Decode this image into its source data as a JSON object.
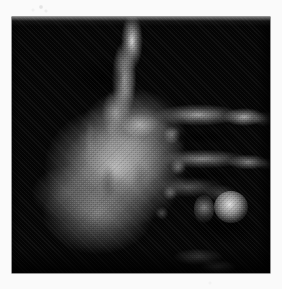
{
  "figure": {
    "kind": "radiograph",
    "view": "dorsopalmar, fingers pointing right",
    "modality_label": "X-ray",
    "caption": "",
    "title": "",
    "page_background_color": "#fafafa",
    "plate": {
      "background_color": "#050505",
      "x": 12,
      "y": 17,
      "width": 258,
      "height": 256,
      "rendering": "grayscale halftone print scan"
    },
    "tones": {
      "black": "#050505",
      "shadow": "#222222",
      "mid_gray": "#8a8a8a",
      "bone_gray": "#bdbdbd",
      "highlight": "#ececec",
      "paper_white": "#fafafa"
    },
    "regions": [
      {
        "name": "thumb-column",
        "label": "thumb / first digit",
        "brightness": "high",
        "cx": 116,
        "cy": 52
      },
      {
        "name": "thumb-web",
        "label": "first web space",
        "brightness": "medium-high",
        "cx": 128,
        "cy": 108
      },
      {
        "name": "palm-mass",
        "label": "metacarpal palm mass",
        "brightness": "high",
        "cx": 104,
        "cy": 150
      },
      {
        "name": "wrist-mass",
        "label": "carpus / wrist",
        "brightness": "medium",
        "cx": 86,
        "cy": 196
      },
      {
        "name": "digit-index",
        "label": "index finger",
        "brightness": "high",
        "cx": 196,
        "cy": 99
      },
      {
        "name": "digit-middle",
        "label": "middle finger",
        "brightness": "medium-high",
        "cx": 200,
        "cy": 143
      },
      {
        "name": "digit-ring",
        "label": "ring finger",
        "brightness": "medium-low",
        "cx": 182,
        "cy": 172
      },
      {
        "name": "knuckles",
        "label": "metacarpophalangeal joints",
        "brightness": "medium-high",
        "cx": 158,
        "cy": 160
      },
      {
        "name": "nodule-highlight",
        "label": "bright round nodule",
        "brightness": "very high",
        "cx": 219,
        "cy": 190
      }
    ],
    "annotations": [],
    "scale_bar": null,
    "markings": [
      {
        "name": "scan-speckle",
        "description": "faint paper speckle on upper-left margin",
        "x": 41,
        "y": 7
      }
    ]
  }
}
